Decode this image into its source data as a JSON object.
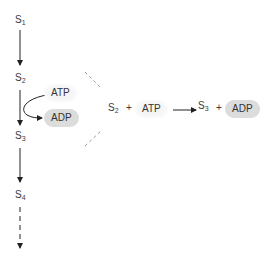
{
  "diagram": {
    "pathway": {
      "substrates": [
        {
          "name": "S",
          "sub": "1"
        },
        {
          "name": "S",
          "sub": "2"
        },
        {
          "name": "S",
          "sub": "3"
        },
        {
          "name": "S",
          "sub": "4"
        }
      ],
      "side_reaction": {
        "input": "ATP",
        "output": "ADP"
      }
    },
    "equation": {
      "reactant1": {
        "name": "S",
        "sub": "2"
      },
      "plus1": "+",
      "reactant2": "ATP",
      "product1": {
        "name": "S",
        "sub": "3"
      },
      "plus2": "+",
      "product2": "ADP"
    },
    "colors": {
      "arrow": "#222222",
      "adp_fill": "#dcdcdc",
      "atp_fill": "#f4f4f4",
      "dashed_guide": "#9a9a9a"
    }
  }
}
